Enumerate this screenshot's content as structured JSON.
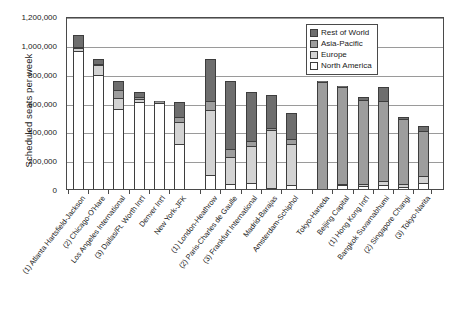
{
  "chart_data": {
    "type": "bar",
    "title": "",
    "xlabel": "",
    "ylabel": "Scheduled seats per week",
    "ylim": [
      0,
      1200000
    ],
    "ytick_values": [
      0,
      200000,
      400000,
      600000,
      800000,
      1000000,
      1200000
    ],
    "ytick_labels": [
      "0",
      "200,000",
      "400,000",
      "600,000",
      "800,000",
      "1,000,000",
      "1,200,000"
    ],
    "grid": true,
    "stacked": true,
    "legend_position": "top-right",
    "legend": [
      "Rest of World",
      "Asia-Pacific",
      "Europe",
      "North America"
    ],
    "series_colors": {
      "North America": "#ffffff",
      "Europe": "#d3d3d3",
      "Asia-Pacific": "#9d9d9d",
      "Rest of World": "#6e6e6e"
    },
    "group_labels": [
      "North America",
      "Europe",
      "Asia-Pacific"
    ],
    "categories": [
      "(1) Atlanta Hartsfield-Jackson",
      "(2) Chicago-O'Hare",
      "Los Angeles International",
      "(3) Dallas/Ft. Worth Int'l",
      "Denver Int'l",
      "New York-JFK",
      "(1) London-Heathrow",
      "(2) Paris-Charles de Gaulle",
      "(3) Frankfurt International",
      "Madrid-Barajas",
      "Amsterdam-Schiphol",
      "Tokyo-Haneda",
      "Beijing Capital",
      "(1) Hong Kong Int'l",
      "Bangkok Suvarnabhumi",
      "(2) Singapore Changi",
      "(3) Tokyo-Narita"
    ],
    "series": [
      {
        "name": "North America",
        "values": [
          955000,
          790000,
          555000,
          605000,
          595000,
          310000,
          100000,
          35000,
          45000,
          10000,
          30000,
          0,
          25000,
          20000,
          30000,
          15000,
          45000
        ]
      },
      {
        "name": "Europe",
        "values": [
          20000,
          70000,
          75000,
          20000,
          5000,
          155000,
          450000,
          185000,
          250000,
          400000,
          285000,
          0,
          10000,
          15000,
          25000,
          20000,
          45000
        ]
      },
      {
        "name": "Asia-Pacific",
        "values": [
          10000,
          10000,
          55000,
          10000,
          5000,
          35000,
          60000,
          55000,
          35000,
          15000,
          30000,
          745000,
          675000,
          580000,
          555000,
          450000,
          315000
        ]
      },
      {
        "name": "Rest of World",
        "values": [
          80000,
          35000,
          65000,
          35000,
          5000,
          105000,
          290000,
          475000,
          345000,
          225000,
          185000,
          5000,
          5000,
          20000,
          95000,
          15000,
          35000
        ]
      }
    ],
    "totals": [
      1065000,
      905000,
      750000,
      670000,
      610000,
      605000,
      900000,
      750000,
      675000,
      650000,
      530000,
      750000,
      715000,
      635000,
      705000,
      500000,
      440000
    ]
  },
  "caption": ""
}
